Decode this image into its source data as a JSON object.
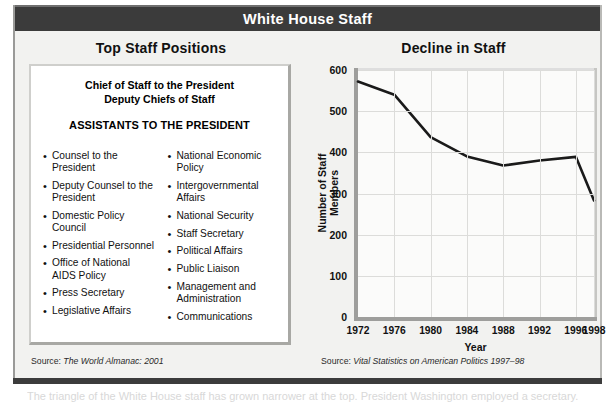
{
  "figure": {
    "title": "White House Staff"
  },
  "left_panel": {
    "heading": "Top Staff Positions",
    "inset_title_lines": [
      "Chief of Staff to the President",
      "Deputy Chiefs of Staff"
    ],
    "inset_subtitle": "ASSISTANTS TO THE PRESIDENT",
    "bullet_marker": "•",
    "column_left": [
      "Counsel to the President",
      "Deputy Counsel to the President",
      "Domestic Policy Council",
      "Presidential Personnel",
      "Office of National AIDS Policy",
      "Press Secretary",
      "Legislative Affairs"
    ],
    "column_right": [
      "National Economic Policy",
      "Intergovernmental Affairs",
      "National Security",
      "Staff Secretary",
      "Political Affairs",
      "Public Liaison",
      "Management and Administration",
      "Communications"
    ],
    "source_prefix": "Source: ",
    "source_title": "The World Almanac: 2001"
  },
  "right_panel": {
    "heading": "Decline in Staff",
    "source_prefix": "Source: ",
    "source_title": "Vital Statistics on American Politics 1997–98"
  },
  "chart_data": {
    "type": "line",
    "title": "Decline in Staff",
    "xlabel": "Year",
    "ylabel": "Number of Staff Members",
    "categories": [
      1972,
      1976,
      1980,
      1984,
      1988,
      1992,
      1996,
      1998
    ],
    "tick_labels_x": [
      "1972",
      "1976",
      "1980",
      "1984",
      "1988",
      "1992",
      "1996",
      "1998"
    ],
    "tick_labels_y": [
      "0",
      "100",
      "200",
      "300",
      "400",
      "500",
      "600"
    ],
    "yticks": [
      0,
      100,
      200,
      300,
      400,
      500,
      600
    ],
    "ylim": [
      0,
      600
    ],
    "xlim": [
      1972,
      1998
    ],
    "grid": true,
    "legend": null,
    "series": [
      {
        "name": "Number of Staff Members",
        "color": "#1a1a1a",
        "values": [
          572,
          540,
          437,
          390,
          368,
          380,
          389,
          283
        ]
      }
    ]
  },
  "footer": {
    "clipped_caption": "The triangle of the White House staff has grown narrower at the top. President Washington employed a secretary."
  },
  "colors": {
    "titlebar_bg": "#3b3b3b",
    "titlebar_text": "#ffffff",
    "panel_bg": "#f2f2f0",
    "inset_bg": "#ffffff",
    "plot_bg": "#fbfbfa",
    "line": "#1a1a1a",
    "grid": "#dcdcda",
    "axis": "#9e9e9c"
  }
}
